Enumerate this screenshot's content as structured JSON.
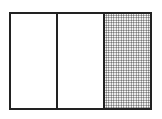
{
  "diagram": {
    "type": "fraction-bar",
    "total_parts": 3,
    "shaded_parts": 1,
    "parts": [
      {
        "index": 0,
        "shaded": false
      },
      {
        "index": 1,
        "shaded": false
      },
      {
        "index": 2,
        "shaded": true
      }
    ],
    "colors": {
      "stroke": "#222222",
      "fill": "#ffffff",
      "shade": "#555555"
    }
  }
}
